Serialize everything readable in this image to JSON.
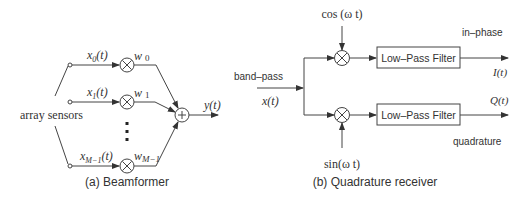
{
  "beamformer": {
    "caption": "(a) Beamformer",
    "sensors_label": "array sensors",
    "inputs": [
      {
        "label": "x",
        "sub": "0",
        "suffix": "(t)",
        "weight": "w",
        "weight_sub": "0"
      },
      {
        "label": "x",
        "sub": "1",
        "suffix": "(t)",
        "weight": "w",
        "weight_sub": "1"
      },
      {
        "label": "x",
        "sub": "M−1",
        "suffix": "(t)",
        "weight": "w",
        "weight_sub": "M−1"
      }
    ],
    "multiply_symbol": "×",
    "sum_symbol": "+",
    "output_label": "y(t)"
  },
  "quadrature": {
    "caption": "(b) Quadrature receiver",
    "input_top_label": "band–pass",
    "input_label": "x(t)",
    "cos_label": "cos (ω t)",
    "sin_label": "sin(ω t)",
    "filter_top": "Low–Pass Filter",
    "filter_bottom": "Low–Pass Filter",
    "in_phase_label": "in–phase",
    "quadrature_label": "quadrature",
    "output_i": "I(t)",
    "output_q": "Q(t)",
    "multiply_symbol": "×"
  }
}
